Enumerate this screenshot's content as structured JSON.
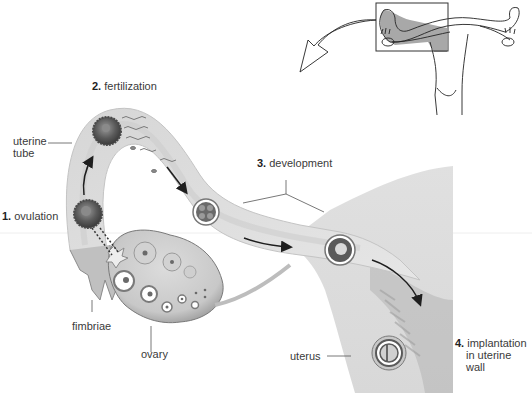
{
  "diagram": {
    "colors": {
      "tissue_light": "#e2e2e2",
      "tissue_mid": "#cfcfcf",
      "tissue_dark": "#8f8f8f",
      "uterus_fill": "#dcdcdc",
      "cell_dark": "#555555",
      "arrow": "#1e1e1e",
      "leader_line": "#555555",
      "inset_highlight": "#9a9a9a"
    },
    "steps": [
      {
        "num": "1.",
        "label": "ovulation"
      },
      {
        "num": "2.",
        "label": "fertilization"
      },
      {
        "num": "3.",
        "label": "development"
      },
      {
        "num": "4.",
        "label": "implantation in uterine wall",
        "lines": [
          "implantation",
          "in uterine",
          "wall"
        ]
      }
    ],
    "anatomy_labels": {
      "uterine_tube": [
        "uterine",
        "tube"
      ],
      "fimbriae": "fimbriae",
      "ovary": "ovary",
      "uterus": "uterus"
    },
    "inset": {
      "description": "Overview of female reproductive tract with boxed region (left uterine tube and ovary) magnified below",
      "highlight": "left uterine tube and ovary"
    }
  }
}
